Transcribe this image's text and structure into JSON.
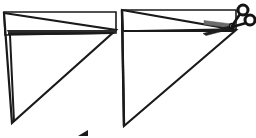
{
  "figure": {
    "title": "Right triangle with top strip being cut off by scissors",
    "background_color": "#ffffff",
    "ink_color": "#1a1a1a",
    "blade_fill": "#6b6b6b",
    "strip_fill": "#2b2b2b",
    "width": 256,
    "height": 138
  },
  "panels": [
    {
      "id": "left-panel",
      "name": "before-cut",
      "caption": "",
      "shape": "right-triangle-with-strip",
      "triangle": {
        "name": "left-triangle",
        "vertices": [
          {
            "x": 4,
            "y": 13
          },
          {
            "x": 116,
            "y": 30
          },
          {
            "x": 12,
            "y": 123
          }
        ],
        "stroke_width": 2.2
      },
      "strip": {
        "name": "left-top-strip",
        "description": "Thin dark strip marking the region to be removed",
        "vertices": [
          {
            "x": 5,
            "y": 14
          },
          {
            "x": 115,
            "y": 31
          },
          {
            "x": 113,
            "y": 34
          },
          {
            "x": 8,
            "y": 35
          }
        ]
      },
      "cut_line": {
        "name": "left-cut-line",
        "from": {
          "x": 8,
          "y": 34
        },
        "to": {
          "x": 114,
          "y": 33
        }
      },
      "outer_rect": {
        "name": "left-bounding-rect",
        "x": 3,
        "y": 12,
        "width": 113,
        "height": 22
      },
      "has_scissors": false
    },
    {
      "id": "right-panel",
      "name": "during-cut",
      "caption": "",
      "shape": "right-triangle-with-strip",
      "triangle": {
        "name": "right-triangle",
        "vertices": [
          {
            "x": 122,
            "y": 10
          },
          {
            "x": 236,
            "y": 30
          },
          {
            "x": 124,
            "y": 126
          }
        ],
        "stroke_width": 2.2
      },
      "strip": {
        "name": "right-top-strip",
        "description": "Upper strip being severed",
        "vertices": [
          {
            "x": 123,
            "y": 11
          },
          {
            "x": 235,
            "y": 29
          },
          {
            "x": 233,
            "y": 32
          },
          {
            "x": 124,
            "y": 32
          }
        ]
      },
      "cut_line": {
        "name": "right-cut-line",
        "from": {
          "x": 124,
          "y": 31
        },
        "to": {
          "x": 234,
          "y": 31
        }
      },
      "outer_rect": {
        "name": "right-bounding-rect",
        "x": 121,
        "y": 9,
        "width": 114,
        "height": 22
      },
      "has_scissors": true
    }
  ],
  "scissors": {
    "name": "scissors-icon",
    "label": "scissors",
    "pivot": {
      "x": 232,
      "y": 26
    },
    "upper_blade": {
      "name": "scissors-upper-blade",
      "tip": {
        "x": 203,
        "y": 22
      },
      "heel": {
        "x": 232,
        "y": 26
      }
    },
    "lower_blade": {
      "name": "scissors-lower-blade",
      "tip": {
        "x": 203,
        "y": 33
      },
      "heel": {
        "x": 232,
        "y": 27
      }
    },
    "handles": [
      {
        "name": "scissors-handle-upper",
        "cx": 243,
        "cy": 10,
        "r": 5.0
      },
      {
        "name": "scissors-handle-lower",
        "cx": 250,
        "cy": 20,
        "r": 5.0
      }
    ],
    "shanks": [
      {
        "name": "scissors-shank-upper",
        "from": {
          "x": 232,
          "y": 26
        },
        "to": {
          "x": 240,
          "y": 14
        }
      },
      {
        "name": "scissors-shank-lower",
        "from": {
          "x": 232,
          "y": 27
        },
        "to": {
          "x": 246,
          "y": 23
        }
      }
    ]
  },
  "marks": {
    "bottom_tick": {
      "name": "bottom-tick-mark",
      "visible": true,
      "x": 82,
      "y": 131
    }
  }
}
